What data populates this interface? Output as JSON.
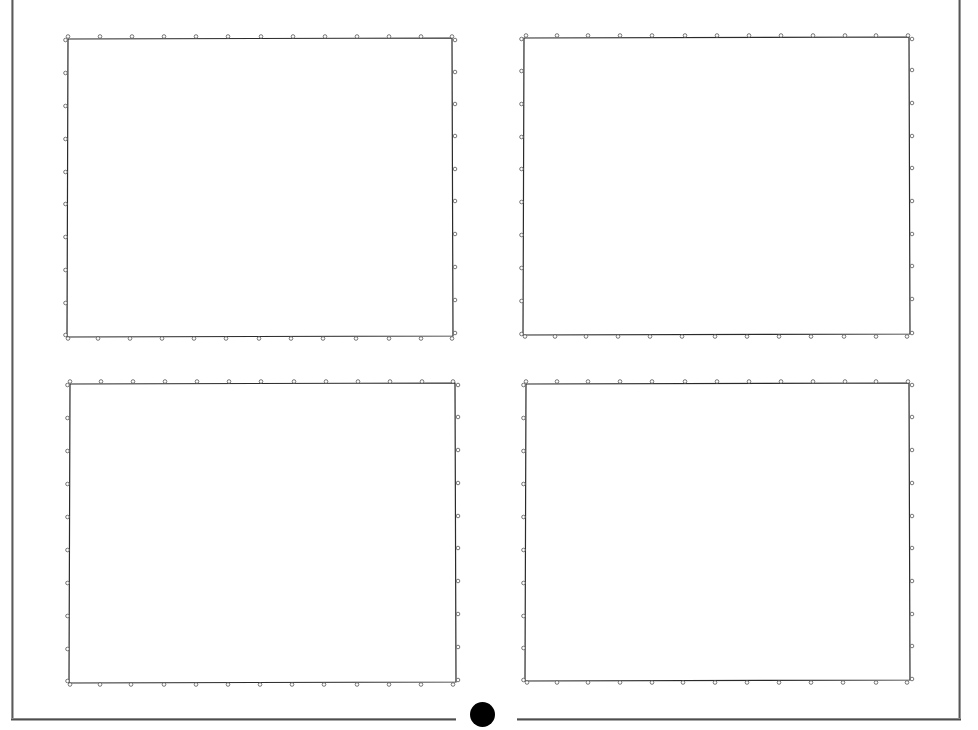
{
  "document": {
    "type": "scanned page",
    "description": "Four blank rectangular panels with registration markers",
    "colors": {
      "background": "#ffffff",
      "panel_border": "#2a2a2a",
      "marker": "#555555",
      "binding_dot": "#000000",
      "frame": "#5a5a5a"
    },
    "binding_dot": {
      "cx": 482,
      "cy": 714,
      "r": 12.5
    },
    "panels": [
      {
        "id": "top-left",
        "x1": 68,
        "y1": 39,
        "x2": 452,
        "y2": 336,
        "top_markers_x": [
          68,
          100,
          132,
          164,
          196,
          228,
          261,
          293,
          325,
          357,
          389,
          421,
          452
        ],
        "bottom_markers_x": [
          68,
          98,
          130,
          162,
          194,
          226,
          259,
          291,
          323,
          356,
          389,
          421,
          452
        ],
        "left_markers_y": [
          40,
          73,
          106,
          139,
          172,
          204,
          237,
          270,
          303,
          335
        ],
        "right_markers_y": [
          40,
          72,
          104,
          136,
          169,
          201,
          234,
          267,
          300,
          333
        ]
      },
      {
        "id": "top-right",
        "x1": 524,
        "y1": 38,
        "x2": 909,
        "y2": 334,
        "top_markers_x": [
          526,
          557,
          588,
          620,
          652,
          685,
          717,
          749,
          781,
          813,
          845,
          876,
          908
        ],
        "bottom_markers_x": [
          525,
          555,
          586,
          618,
          650,
          682,
          715,
          747,
          779,
          811,
          844,
          876,
          907
        ],
        "left_markers_y": [
          39,
          71,
          104,
          137,
          169,
          202,
          235,
          268,
          301,
          334
        ],
        "right_markers_y": [
          39,
          70,
          103,
          136,
          168,
          201,
          234,
          266,
          299,
          333
        ]
      },
      {
        "id": "bottom-left",
        "x1": 70,
        "y1": 384,
        "x2": 455,
        "y2": 682,
        "top_markers_x": [
          70,
          101,
          133,
          165,
          197,
          229,
          261,
          294,
          326,
          358,
          390,
          422,
          453
        ],
        "bottom_markers_x": [
          70,
          100,
          131,
          164,
          196,
          228,
          260,
          292,
          324,
          357,
          389,
          421,
          453
        ],
        "left_markers_y": [
          385,
          418,
          451,
          484,
          517,
          550,
          583,
          616,
          649,
          681
        ],
        "right_markers_y": [
          385,
          417,
          450,
          483,
          516,
          548,
          581,
          614,
          647,
          680
        ]
      },
      {
        "id": "bottom-right",
        "x1": 526,
        "y1": 384,
        "x2": 909,
        "y2": 680,
        "top_markers_x": [
          526,
          557,
          588,
          620,
          652,
          685,
          717,
          749,
          781,
          813,
          845,
          876,
          908
        ],
        "bottom_markers_x": [
          527,
          557,
          588,
          620,
          652,
          683,
          715,
          747,
          779,
          811,
          843,
          876,
          907
        ],
        "left_markers_y": [
          385,
          418,
          451,
          484,
          517,
          550,
          583,
          616,
          648,
          680
        ],
        "right_markers_y": [
          385,
          417,
          450,
          483,
          516,
          548,
          581,
          614,
          646,
          679
        ]
      }
    ]
  }
}
